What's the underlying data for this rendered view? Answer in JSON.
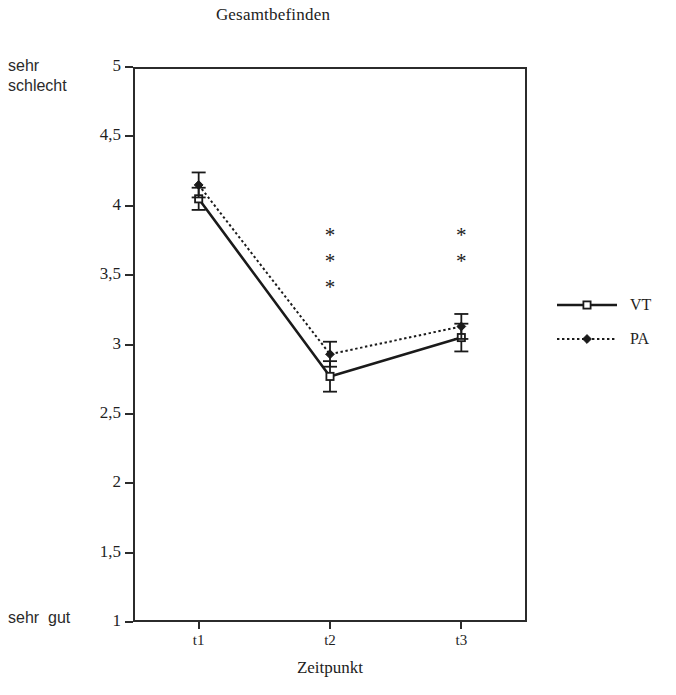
{
  "chart_data": {
    "type": "line",
    "title": "Gesamtbefinden",
    "xlabel": "Zeitpunkt",
    "ylabel": "",
    "categories": [
      "t1",
      "t2",
      "t3"
    ],
    "x": [
      1,
      2,
      3
    ],
    "ylim": [
      1,
      5
    ],
    "xlim": [
      0.5,
      3.5
    ],
    "grid": false,
    "legend_position": "right",
    "y_ticks": [
      1,
      1.5,
      2,
      2.5,
      3,
      3.5,
      4,
      4.5,
      5
    ],
    "y_tick_labels": [
      "1",
      "1,5",
      "2",
      "2,5",
      "3",
      "3,5",
      "4",
      "4,5",
      "5"
    ],
    "scale_anchor_high": "sehr\nschlecht",
    "scale_anchor_low": "sehr  gut",
    "series": [
      {
        "name": "VT",
        "line_style": "solid",
        "marker": "open-square",
        "color": "#1a1a1a",
        "values": [
          4.05,
          2.77,
          3.05
        ],
        "err_low": [
          3.97,
          2.66,
          2.95
        ],
        "err_high": [
          4.13,
          2.88,
          3.15
        ]
      },
      {
        "name": "PA",
        "line_style": "dotted",
        "marker": "filled-diamond",
        "color": "#1a1a1a",
        "values": [
          4.15,
          2.93,
          3.13
        ],
        "err_low": [
          4.06,
          2.84,
          3.04
        ],
        "err_high": [
          4.24,
          3.02,
          3.22
        ]
      }
    ],
    "annotations": [
      {
        "name": "significance-t2",
        "at_category": "t2",
        "symbol": "*",
        "count": 3,
        "y_top": 3.78
      },
      {
        "name": "significance-t3",
        "at_category": "t3",
        "symbol": "*",
        "count": 2,
        "y_top": 3.78
      }
    ]
  },
  "legend": {
    "items": [
      {
        "label": "VT",
        "sample": "solid-line-open-square"
      },
      {
        "label": "PA",
        "sample": "dotted-line-filled-diamond"
      }
    ]
  },
  "colors": {
    "ink": "#1a1a1a",
    "axis": "#2b2b2b",
    "background": "#ffffff"
  }
}
